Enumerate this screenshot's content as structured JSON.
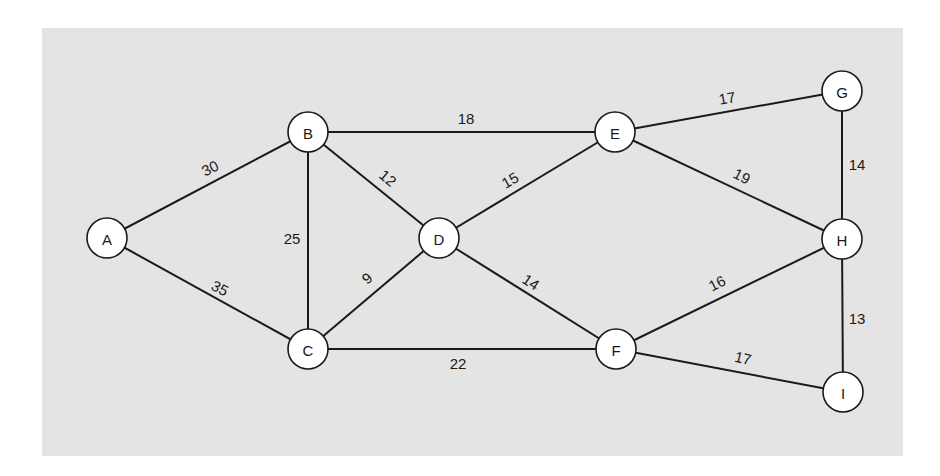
{
  "diagram": {
    "type": "weighted-undirected-graph",
    "background": "#e4e4e4",
    "nodes": [
      {
        "id": "A",
        "label": "A",
        "x": 107,
        "y": 238
      },
      {
        "id": "B",
        "label": "B",
        "x": 308,
        "y": 132
      },
      {
        "id": "C",
        "label": "C",
        "x": 308,
        "y": 349
      },
      {
        "id": "D",
        "label": "D",
        "x": 439,
        "y": 238
      },
      {
        "id": "E",
        "label": "E",
        "x": 615,
        "y": 132
      },
      {
        "id": "F",
        "label": "F",
        "x": 616,
        "y": 349
      },
      {
        "id": "G",
        "label": "G",
        "x": 842,
        "y": 91
      },
      {
        "id": "H",
        "label": "H",
        "x": 842,
        "y": 239
      },
      {
        "id": "I",
        "label": "I",
        "x": 843,
        "y": 392
      }
    ],
    "edges": [
      {
        "from": "A",
        "to": "B",
        "weight": "30",
        "lx": 210,
        "ly": 168,
        "rot": -27
      },
      {
        "from": "A",
        "to": "C",
        "weight": "35",
        "lx": 220,
        "ly": 288,
        "rot": 28
      },
      {
        "from": "B",
        "to": "C",
        "weight": "25",
        "lx": 292,
        "ly": 238,
        "rot": 0
      },
      {
        "from": "B",
        "to": "D",
        "weight": "12",
        "lx": 388,
        "ly": 178,
        "rot": 40
      },
      {
        "from": "B",
        "to": "E",
        "weight": "18",
        "lx": 466,
        "ly": 118,
        "rot": 0
      },
      {
        "from": "C",
        "to": "D",
        "weight": "9",
        "lx": 367,
        "ly": 278,
        "rot": -40
      },
      {
        "from": "C",
        "to": "F",
        "weight": "22",
        "lx": 458,
        "ly": 363,
        "rot": 0
      },
      {
        "from": "D",
        "to": "E",
        "weight": "15",
        "lx": 510,
        "ly": 180,
        "rot": -30
      },
      {
        "from": "D",
        "to": "F",
        "weight": "14",
        "lx": 531,
        "ly": 282,
        "rot": 33
      },
      {
        "from": "E",
        "to": "G",
        "weight": "17",
        "lx": 727,
        "ly": 98,
        "rot": -10
      },
      {
        "from": "E",
        "to": "H",
        "weight": "19",
        "lx": 742,
        "ly": 176,
        "rot": 27
      },
      {
        "from": "G",
        "to": "H",
        "weight": "14",
        "lx": 857,
        "ly": 164,
        "rot": 0
      },
      {
        "from": "F",
        "to": "H",
        "weight": "16",
        "lx": 717,
        "ly": 283,
        "rot": -27
      },
      {
        "from": "F",
        "to": "I",
        "weight": "17",
        "lx": 743,
        "ly": 358,
        "rot": 13
      },
      {
        "from": "H",
        "to": "I",
        "weight": "13",
        "lx": 857,
        "ly": 318,
        "rot": 0
      }
    ]
  }
}
